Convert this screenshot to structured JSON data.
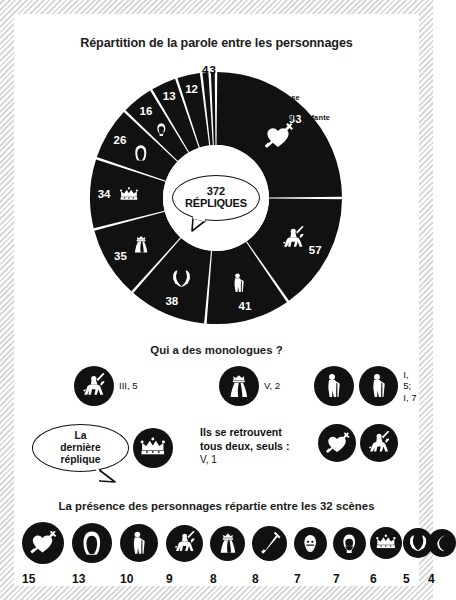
{
  "title": "Répartition de la parole entre les personnages",
  "chart_data": {
    "type": "pie",
    "title": "Répartition de la parole entre les personnages",
    "center_value": "372",
    "center_unit": "RÉPLIQUES",
    "total": 372,
    "categories": [
      "93",
      "57",
      "41",
      "38",
      "35",
      "34",
      "26",
      "16",
      "13",
      "12",
      "4",
      "3"
    ],
    "values": [
      93,
      57,
      41,
      38,
      35,
      34,
      26,
      16,
      13,
      12,
      4,
      3
    ],
    "labels": [
      "93",
      "57",
      "41",
      "38",
      "35",
      "34",
      "26",
      "16",
      "13",
      "12",
      "4",
      "3"
    ],
    "icons": [
      "heart-pierced-icon",
      "knight-horse-icon",
      "old-man-icon",
      "laurel-wreath-icon",
      "queen-crown-gown-icon",
      "crown-icon",
      "nun-hood-icon",
      "monk-hood-icon",
      "page-boy-icon",
      "sword-icon",
      "don-alonse-sliver",
      "page-infante-sliver"
    ],
    "callouts": [
      {
        "label": "Don Alonse",
        "value": 4
      },
      {
        "label": "Le Page de l'Infante",
        "value": 3
      }
    ],
    "legend_position": "inline-labels",
    "grid": false
  },
  "monologues": {
    "heading": "Qui a des monologues ?",
    "items": [
      {
        "icon": "knight-horse-icon",
        "ref": "III, 5"
      },
      {
        "icon": "queen-crown-gown-icon",
        "ref": "V, 2"
      },
      {
        "icon": "old-man-icon",
        "ref": ""
      },
      {
        "icon": "old-man-icon",
        "ref": "I, 5;\nI, 7"
      }
    ]
  },
  "last_line": {
    "text": "La\ndernière\nréplique",
    "icon": "crown-icon"
  },
  "together": {
    "text": "Ils se retrouvent\ntous deux, seuls :",
    "ref": "V, 1",
    "icons": [
      "heart-pierced-icon",
      "knight-horse-icon"
    ]
  },
  "presence": {
    "heading": "La présence des personnages répartie entre les 32 scènes",
    "scenes_total": 32,
    "items": [
      {
        "icon": "heart-pierced-icon",
        "count": "15"
      },
      {
        "icon": "nun-hood-icon",
        "count": "13"
      },
      {
        "icon": "old-man-icon",
        "count": "10"
      },
      {
        "icon": "knight-horse-icon",
        "count": "9"
      },
      {
        "icon": "queen-crown-gown-icon",
        "count": "8"
      },
      {
        "icon": "sword-icon",
        "count": "8"
      },
      {
        "icon": "page-boy-icon",
        "count": "7"
      },
      {
        "icon": "monk-hood-icon",
        "count": "7"
      },
      {
        "icon": "crown-icon",
        "count": "6"
      },
      {
        "icon": "laurel-wreath-icon",
        "count": "5"
      },
      {
        "icon": "moon-sliver-icon",
        "count": "4"
      }
    ]
  },
  "colors": {
    "ink": "#111111",
    "paper": "#ffffff",
    "donut_fill": "#111111",
    "separator": "#e8e8e8"
  }
}
